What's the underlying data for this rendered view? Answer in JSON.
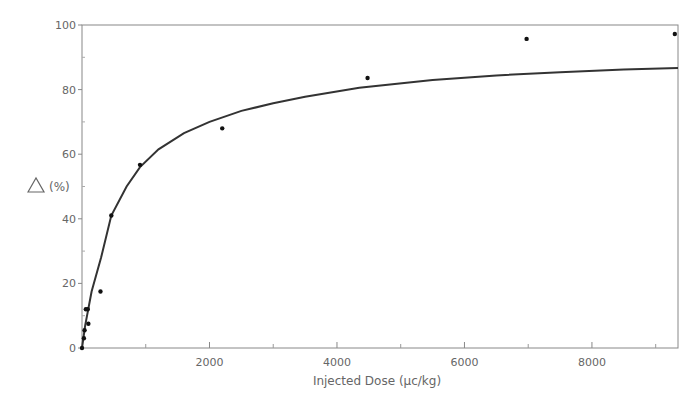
{
  "chart_data": {
    "type": "scatter",
    "title": "",
    "xlabel": "Injected Dose (μc/kg)",
    "ylabel": "△ (%)",
    "xlim": [
      0,
      9350
    ],
    "ylim": [
      0,
      100
    ],
    "grid": false,
    "legend": null,
    "x_ticks": [
      2000,
      4000,
      6000,
      8000
    ],
    "x_minor_ticks": [
      1000,
      3000,
      5000,
      7000,
      9000
    ],
    "y_ticks": [
      0,
      20,
      40,
      60,
      80,
      100
    ],
    "series": [
      {
        "name": "measured",
        "kind": "points",
        "x": [
          0,
          30,
          40,
          60,
          90,
          100,
          290,
          460,
          910,
          2200,
          4480,
          6975,
          9300
        ],
        "y": [
          0,
          3,
          5.5,
          12,
          12,
          7.5,
          17.5,
          41,
          56.7,
          68,
          83.6,
          95.7,
          97.2
        ]
      },
      {
        "name": "fitted curve",
        "kind": "line",
        "x": [
          0,
          50,
          150,
          300,
          460,
          700,
          910,
          1200,
          1600,
          2000,
          2500,
          3000,
          3500,
          4350,
          5500,
          6500,
          7500,
          8500,
          9350
        ],
        "y": [
          0,
          7,
          17.5,
          28,
          41,
          50,
          56,
          61.5,
          66.5,
          70,
          73.4,
          75.8,
          77.8,
          80.6,
          83,
          84.4,
          85.4,
          86.2,
          86.7
        ]
      }
    ]
  },
  "axes": {
    "y_tick_labels": [
      "0",
      "20",
      "40",
      "60",
      "80",
      "100"
    ],
    "x_tick_labels": [
      "2000",
      "4000",
      "6000",
      "8000"
    ],
    "y_title": "(%)",
    "y_title_symbol": "triangle",
    "x_title": "Injected Dose (μc/kg)"
  }
}
